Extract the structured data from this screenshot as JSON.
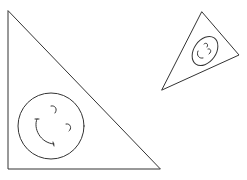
{
  "figure": {
    "stroke_color": "#333333",
    "background": "#ffffff",
    "shapes": [
      {
        "name": "large-right-triangle",
        "points": "8,11 8,169 160,169",
        "face": {
          "type": "circle",
          "cx": 51,
          "cy": 126,
          "r": 33
        }
      },
      {
        "name": "small-rotated-triangle",
        "points": "202,12 239,55 162,90",
        "face": {
          "type": "ellipse",
          "cx": 205,
          "cy": 51,
          "rx": 16,
          "ry": 11,
          "rotate": -55
        }
      }
    ]
  }
}
